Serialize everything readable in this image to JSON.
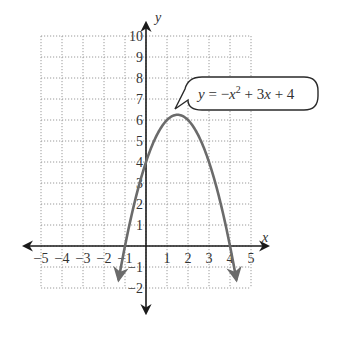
{
  "chart_data": {
    "type": "line",
    "title": "",
    "equation": "y = -x^2 + 3x + 4",
    "callout": {
      "prefix": "y = −",
      "x1": "x",
      "exp": "2",
      "mid": " + 3",
      "x2": "x",
      "suffix": " + 4"
    },
    "xlabel": "x",
    "ylabel": "y",
    "xlim": [
      -5,
      5
    ],
    "ylim": [
      -2,
      10
    ],
    "grid": true,
    "x_ticks": [
      "−5",
      "−4",
      "−3",
      "−2",
      "−1",
      "1",
      "2",
      "3",
      "4",
      "5"
    ],
    "y_ticks": [
      "10",
      "9",
      "8",
      "7",
      "6",
      "5",
      "4",
      "3",
      "2",
      "1",
      "−1",
      "−2"
    ],
    "series": [
      {
        "name": "y = -x^2 + 3x + 4",
        "coefficients": {
          "a": -1,
          "b": 3,
          "c": 4
        },
        "x_range": [
          -1.3,
          4.3
        ],
        "vertex": [
          1.5,
          6.25
        ],
        "roots": [
          -1,
          4
        ],
        "y_intercept": 4,
        "color": "#6b6b6b"
      }
    ]
  },
  "colors": {
    "axis": "#1a1a1a",
    "grid": "#9a9a9a",
    "curve": "#6b6b6b",
    "text": "#333333"
  }
}
